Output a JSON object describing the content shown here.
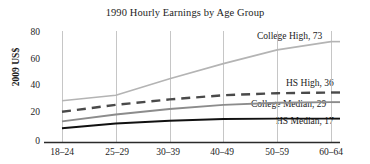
{
  "chart_data": {
    "type": "line",
    "title": "1990 Hourly Earnings by Age Group",
    "xlabel": "",
    "ylabel": "2009 US$",
    "categories": [
      "18–24",
      "25–29",
      "30–39",
      "40–49",
      "50–59",
      "60–64"
    ],
    "ylim": [
      0,
      80
    ],
    "yticks": [
      0,
      20,
      40,
      60,
      80
    ],
    "ytick_labels": [
      "0",
      "20",
      "40",
      "60",
      "80"
    ],
    "grid": "vertical",
    "legend_position": "inline-right-labels",
    "series": [
      {
        "name": "College High",
        "end_value": 73,
        "end_label": "College High, 73",
        "color": "#b4b4b4",
        "style": "solid",
        "width": 1.6,
        "values": [
          30,
          34,
          46,
          57,
          67,
          73
        ]
      },
      {
        "name": "HS High",
        "end_value": 36,
        "end_label": "HS High, 36",
        "color": "#4a4a4a",
        "style": "dashed",
        "width": 2.4,
        "values": [
          22,
          27,
          31,
          34,
          35.5,
          36
        ]
      },
      {
        "name": "College Median",
        "end_value": 29,
        "end_label": "College Median, 29",
        "color": "#8c8c8c",
        "style": "solid",
        "width": 1.9,
        "values": [
          15,
          20,
          24,
          27,
          28.5,
          29
        ]
      },
      {
        "name": "HS Median",
        "end_value": 17,
        "end_label": "HS Median, 17",
        "color": "#111111",
        "style": "solid",
        "width": 1.9,
        "values": [
          10,
          13.5,
          15.5,
          16.7,
          17,
          17
        ]
      }
    ]
  },
  "axes": {
    "y_label": "2009 US$",
    "y_ticks": [
      "80",
      "60",
      "40",
      "20",
      "0"
    ],
    "x_ticks": [
      "18–24",
      "25–29",
      "30–39",
      "40–49",
      "50–59",
      "60–64"
    ]
  },
  "labels": {
    "college_high": "College High, 73",
    "hs_high": "HS High, 36",
    "college_median": "College Median, 29",
    "hs_median": "HS Median, 17"
  },
  "colors": {
    "college_high": "#b4b4b4",
    "hs_high": "#4a4a4a",
    "college_median": "#8c8c8c",
    "hs_median": "#111111",
    "axis": "#2b2b2b",
    "gridline": "#bfbfbf",
    "text": "#1c1c1c"
  },
  "title": "1990 Hourly Earnings by Age Group"
}
